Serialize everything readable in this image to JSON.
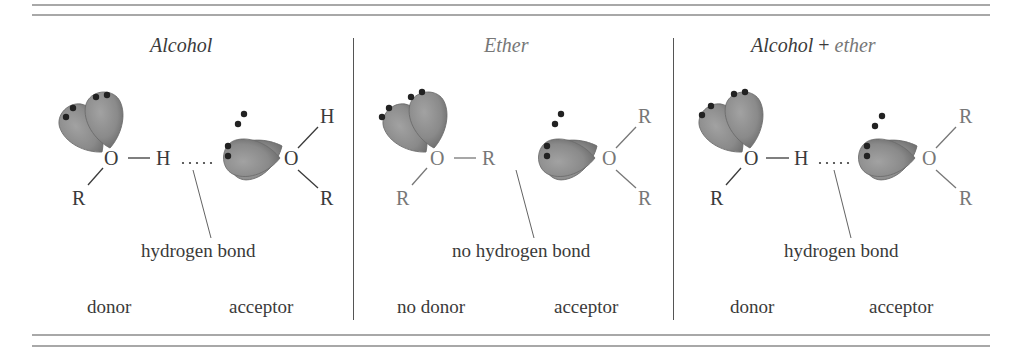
{
  "colors": {
    "text_dark": "#3a3a3a",
    "text_gray": "#777777",
    "lobe": "#8c8c8c",
    "lobe_dark": "#6e6e6e",
    "rule": "#a8a8a8"
  },
  "panels": [
    {
      "title": "Alcohol",
      "left_molecule": {
        "center_atom": "O",
        "bond_to": "H",
        "substituent": "R"
      },
      "right_molecule": {
        "center_atom": "O",
        "top": "H",
        "bottom": "R"
      },
      "interaction_label": "hydrogen bond",
      "left_role": "donor",
      "right_role": "acceptor"
    },
    {
      "title": "Ether",
      "left_molecule": {
        "center_atom": "O",
        "bond_to": "R",
        "substituent": "R"
      },
      "right_molecule": {
        "center_atom": "O",
        "top": "R",
        "bottom": "R"
      },
      "interaction_label": "no hydrogen bond",
      "left_role": "no donor",
      "right_role": "acceptor"
    },
    {
      "title_part1": "Alcohol",
      "title_plus": "+",
      "title_part2": "ether",
      "left_molecule": {
        "center_atom": "O",
        "bond_to": "H",
        "substituent": "R"
      },
      "right_molecule": {
        "center_atom": "O",
        "top": "R",
        "bottom": "R"
      },
      "interaction_label": "hydrogen bond",
      "left_role": "donor",
      "right_role": "acceptor"
    }
  ],
  "icons": {
    "lone_pair_lobe": "lone-pair-orbital-lobe",
    "hbond_dots": "dotted-hydrogen-bond"
  }
}
